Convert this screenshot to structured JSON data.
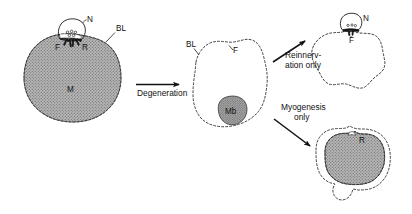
{
  "figure": {
    "background_color": "#ffffff",
    "ink_color": "#111111",
    "muscle_fill_color": "#9e9e9e",
    "myoblast_fill_color": "#8a8a8a"
  },
  "panels": {
    "original": {
      "name": "Innervated adult muscle fiber",
      "labels": {
        "nerve": "N",
        "basal_lamina": "BL",
        "folds": "F",
        "receptors": "R",
        "muscle": "M"
      }
    },
    "degenerated": {
      "name": "Empty basal lamina sheath with myoblast",
      "labels": {
        "basal_lamina": "BL",
        "folds": "F",
        "myoblast": "Mb"
      }
    },
    "reinnervated": {
      "name": "Reinnervated sheath without muscle regeneration",
      "labels": {
        "nerve": "N",
        "folds": "F"
      }
    },
    "regenerated": {
      "name": "Regenerated muscle fiber without reinnervation",
      "labels": {
        "receptors": "R"
      }
    }
  },
  "arrows": {
    "degeneration": "Degeneration",
    "reinnervation_line1": "Reinnerv-",
    "reinnervation_line2": "ation only",
    "myogenesis_line1": "Myogenesis",
    "myogenesis_line2": "only"
  }
}
